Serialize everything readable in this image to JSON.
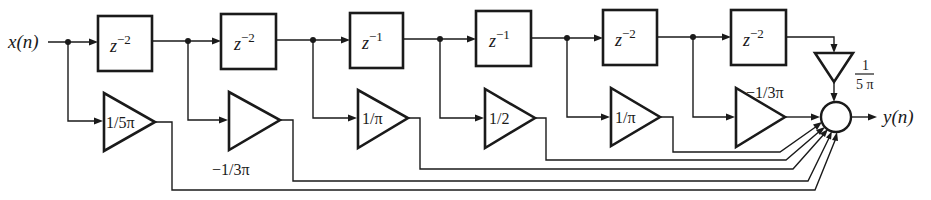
{
  "diagram": {
    "type": "FIR filter direct-form block diagram",
    "input_label": "x(n)",
    "output_label": "y(n)",
    "delays": [
      {
        "id": "d1",
        "base": "z",
        "exp": "−2"
      },
      {
        "id": "d2",
        "base": "z",
        "exp": "−2"
      },
      {
        "id": "d3",
        "base": "z",
        "exp": "−1"
      },
      {
        "id": "d4",
        "base": "z",
        "exp": "−1"
      },
      {
        "id": "d5",
        "base": "z",
        "exp": "−2"
      },
      {
        "id": "d6",
        "base": "z",
        "exp": "−2"
      }
    ],
    "gains": [
      {
        "id": "g0",
        "label": "1/5π",
        "label_position": "inside"
      },
      {
        "id": "g1",
        "label": "−1/3π",
        "label_position": "below"
      },
      {
        "id": "g2",
        "label": "1/π",
        "label_position": "inside"
      },
      {
        "id": "g3",
        "label": "1/2",
        "label_position": "inside"
      },
      {
        "id": "g4",
        "label": "1/π",
        "label_position": "inside"
      },
      {
        "id": "g5",
        "label": "−1/3π",
        "label_position": "above"
      },
      {
        "id": "g6",
        "label_num": "1",
        "label_den": "5 π",
        "label_position": "right",
        "orientation": "down"
      }
    ],
    "summer": {
      "id": "sum",
      "shape": "circle",
      "inputs": 7
    }
  },
  "colors": {
    "ink": "#1a1a1a",
    "background": "#ffffff"
  }
}
